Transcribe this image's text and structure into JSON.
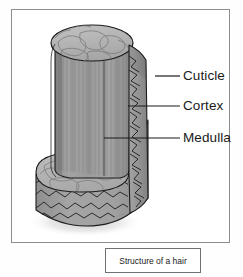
{
  "figure": {
    "title": "Structure of a hair",
    "caption": "Structure of a hair",
    "labels": [
      {
        "id": "cuticle",
        "text": "Cuticle"
      },
      {
        "id": "cortex",
        "text": "Cortex"
      },
      {
        "id": "medulla",
        "text": "Medulla"
      }
    ],
    "colors": {
      "outer_frame": "#8b8d8f",
      "caption_border": "#6e7072",
      "outline": "#1c1c1c",
      "cortex_fill": "#9a9a9a",
      "cut_surface_fill": "#b9b9b9",
      "cuticle_fill": "#a2a2a2",
      "shadow": "#cfcfcf",
      "label_text": "#1a1a1a",
      "background": "#ffffff"
    }
  }
}
